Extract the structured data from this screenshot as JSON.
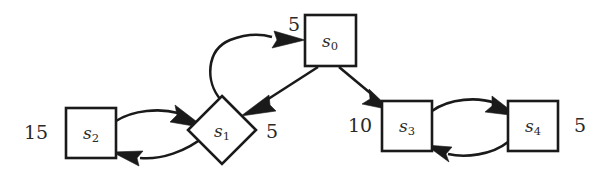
{
  "figure": {
    "type": "directed-graph-diagram",
    "background_color": "#ffffff",
    "stroke_color": "#1a1a1a",
    "text_color": "#2a2a2a"
  },
  "nodes": [
    {
      "id": "s0",
      "label_base": "s",
      "label_sub": "0",
      "shape": "square",
      "weight": "5",
      "weight_position": "top-left"
    },
    {
      "id": "s1",
      "label_base": "s",
      "label_sub": "1",
      "shape": "diamond",
      "weight": "5",
      "weight_position": "right"
    },
    {
      "id": "s2",
      "label_base": "s",
      "label_sub": "2",
      "shape": "square",
      "weight": "15",
      "weight_position": "left"
    },
    {
      "id": "s3",
      "label_base": "s",
      "label_sub": "3",
      "shape": "square",
      "weight": "10",
      "weight_position": "left"
    },
    {
      "id": "s4",
      "label_base": "s",
      "label_sub": "4",
      "shape": "square",
      "weight": "5",
      "weight_position": "right"
    }
  ],
  "edges": [
    {
      "from": "s1",
      "to": "s0",
      "style": "curved"
    },
    {
      "from": "s0",
      "to": "s1",
      "style": "straight"
    },
    {
      "from": "s0",
      "to": "s3",
      "style": "straight"
    },
    {
      "from": "s2",
      "to": "s1",
      "style": "curved"
    },
    {
      "from": "s1",
      "to": "s2",
      "style": "curved"
    },
    {
      "from": "s3",
      "to": "s4",
      "style": "curved"
    },
    {
      "from": "s4",
      "to": "s3",
      "style": "curved"
    }
  ]
}
